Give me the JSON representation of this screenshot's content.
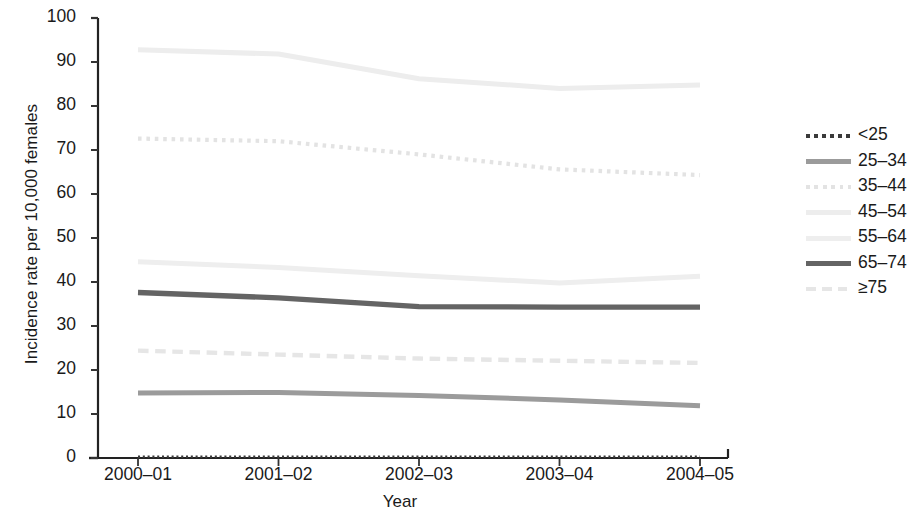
{
  "chart_data": {
    "type": "line",
    "title": "",
    "xlabel": "Year",
    "ylabel": "Incidence rate per 10,000 females",
    "categories": [
      "2000–01",
      "2001–02",
      "2002–03",
      "2003–04",
      "2004–05"
    ],
    "x_tick_labels": [
      "2000–01",
      "2001–02",
      "2002–03",
      "2003–04",
      "2004–05"
    ],
    "y_tick_labels": [
      "0",
      "10",
      "20",
      "30",
      "40",
      "50",
      "60",
      "70",
      "80",
      "90",
      "100"
    ],
    "y_ticks": [
      0,
      10,
      20,
      30,
      40,
      50,
      60,
      70,
      80,
      90,
      100
    ],
    "ylim": [
      0,
      100
    ],
    "grid": false,
    "legend_position": "right",
    "series": [
      {
        "name": "<25",
        "values": [
          0.3,
          0.3,
          0.3,
          0.3,
          0.3
        ],
        "color": "#3a3a3a",
        "style": "dotted",
        "width": 2.4
      },
      {
        "name": "25–34",
        "values": [
          14.8,
          14.9,
          14.2,
          13.2,
          11.9
        ],
        "color": "#9b9b9b",
        "style": "solid",
        "width": 5.0
      },
      {
        "name": "35–44",
        "values": [
          72.6,
          72.0,
          69.0,
          65.6,
          64.3
        ],
        "color": "#e3e3e3",
        "style": "dotted",
        "width": 4.2
      },
      {
        "name": "45–54",
        "values": [
          92.8,
          91.8,
          86.2,
          84.0,
          84.8
        ],
        "color": "#ededed",
        "style": "solid",
        "width": 5.0
      },
      {
        "name": "55–64",
        "values": [
          44.6,
          43.3,
          41.4,
          39.8,
          41.3
        ],
        "color": "#eeeeee",
        "style": "solid",
        "width": 5.0
      },
      {
        "name": "65–74",
        "values": [
          37.6,
          36.4,
          34.4,
          34.3,
          34.3
        ],
        "color": "#646464",
        "style": "solid",
        "width": 5.4
      },
      {
        "name": "≥75",
        "values": [
          24.4,
          23.5,
          22.6,
          22.1,
          21.6
        ],
        "color": "#e6e6e6",
        "style": "dashed",
        "width": 4.4
      }
    ]
  },
  "axis": {
    "y_title": "Incidence rate per 10,000 females",
    "x_title": "Year"
  },
  "legend": {
    "items": [
      {
        "label": "<25"
      },
      {
        "label": "25–34"
      },
      {
        "label": "35–44"
      },
      {
        "label": "45–54"
      },
      {
        "label": "55–64"
      },
      {
        "label": "65–74"
      },
      {
        "label": "≥75"
      }
    ]
  }
}
